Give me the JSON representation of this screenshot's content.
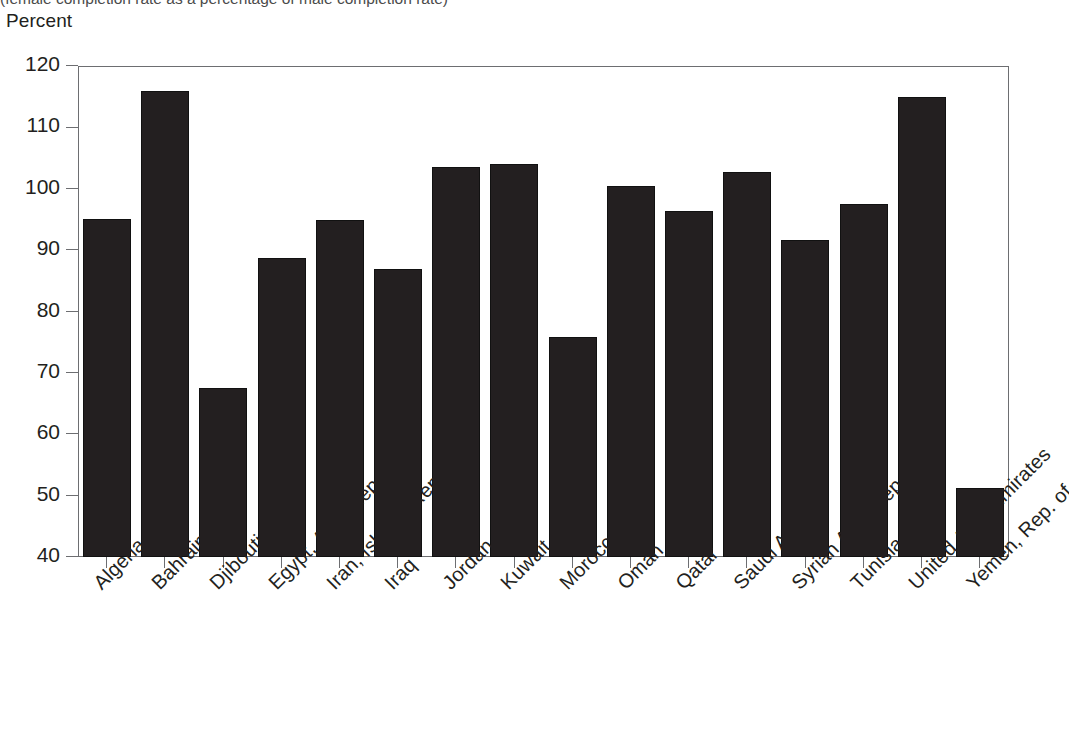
{
  "header": {
    "subtitle": "(female completion rate as a percentage of male completion rate)",
    "unit_label": "Percent"
  },
  "axis": {
    "y_ticks": [
      "120",
      "110",
      "100",
      "90",
      "80",
      "70",
      "60",
      "50",
      "40"
    ]
  },
  "colors": {
    "bar": "#231f20",
    "axis": "#6d6e71",
    "text": "#231f20",
    "background": "#ffffff"
  },
  "chart_data": {
    "type": "bar",
    "title": "",
    "subtitle": "(female completion rate as a percentage of male completion rate)",
    "xlabel": "",
    "ylabel": "Percent",
    "ylim": [
      40,
      120
    ],
    "ytick_values": [
      40,
      50,
      60,
      70,
      80,
      90,
      100,
      110,
      120
    ],
    "grid": false,
    "legend": "none",
    "categories": [
      "Algeria",
      "Bahrain",
      "Djibouti",
      "Egypt, Arab Rep. of",
      "Iran, Islamic Rep. of",
      "Iraq",
      "Jordan",
      "Kuwait",
      "Morocco",
      "Oman",
      "Qatar",
      "Saudi Arabia",
      "Syrian Arab Rep.",
      "Tunisia",
      "United Arab Emirates",
      "Yemen, Rep. of"
    ],
    "values": [
      95.0,
      116.0,
      67.5,
      88.7,
      94.9,
      87.0,
      103.6,
      104.0,
      75.8,
      100.5,
      96.4,
      102.7,
      91.6,
      97.5,
      115.0,
      51.3
    ]
  }
}
